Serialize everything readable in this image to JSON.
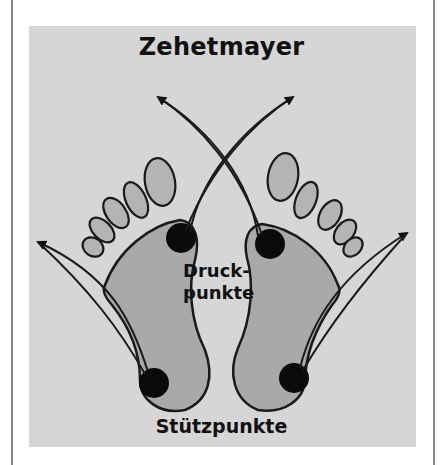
{
  "diagram": {
    "title": "Zehetmayer",
    "labels": {
      "pressure_points_line1": "Druck-",
      "pressure_points_line2": "punkte",
      "support_points": "Stützpunkte"
    },
    "colors": {
      "panel_background": "#d6d6d6",
      "foot_fill": "#a9a9a9",
      "toe_fill": "#b4b4b4",
      "outline": "#1a1a1a",
      "point_fill": "#0a0a0a",
      "frame_line": "#8a8a8a"
    },
    "feet": [
      {
        "side": "left",
        "ball_point": [
          181,
          238
        ],
        "heel_point": [
          154,
          383
        ]
      },
      {
        "side": "right",
        "ball_point": [
          270,
          244
        ],
        "heel_point": [
          294,
          378
        ]
      }
    ],
    "arrows": [
      {
        "from": "left-ball",
        "to": "top-right",
        "tip": [
          294,
          96
        ]
      },
      {
        "from": "right-ball",
        "to": "top-left",
        "tip": [
          157,
          96
        ]
      },
      {
        "from": "left-heel",
        "to": "left",
        "tip": [
          37,
          241
        ]
      },
      {
        "from": "right-heel",
        "to": "right",
        "tip": [
          408,
          232
        ]
      }
    ]
  }
}
